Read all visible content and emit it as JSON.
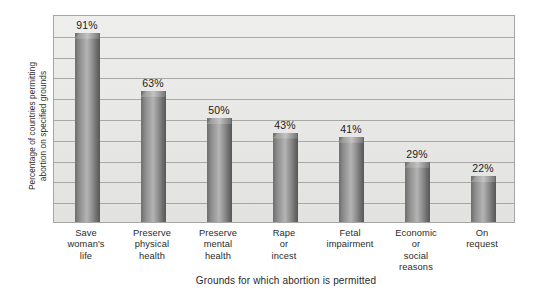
{
  "chart_data": {
    "type": "bar",
    "title": "",
    "xlabel": "Grounds for which abortion is permitted",
    "ylabel": "Percentage of countries permitting abortion on specified grounds",
    "ylabel_line1": "Percentage of countries permitting",
    "ylabel_line2": "abortion on specified grounds",
    "categories": [
      "Save woman's life",
      "Preserve physical health",
      "Preserve mental health",
      "Rape or incest",
      "Fetal impairment",
      "Economic or social reasons",
      "On request"
    ],
    "category_lines": [
      [
        "Save",
        "woman's",
        "life"
      ],
      [
        "Preserve",
        "physical",
        "health"
      ],
      [
        "Preserve",
        "mental",
        "health"
      ],
      [
        "Rape",
        "or",
        "incest"
      ],
      [
        "Fetal",
        "impairment"
      ],
      [
        "Economic",
        "or",
        "social",
        "reasons"
      ],
      [
        "On",
        "request"
      ]
    ],
    "values": [
      91,
      63,
      50,
      43,
      41,
      29,
      22
    ],
    "data_labels": [
      "91%",
      "63%",
      "50%",
      "43%",
      "41%",
      "29%",
      "22%"
    ],
    "ylim": [
      0,
      100
    ],
    "grid": true,
    "gridline_count": 10,
    "gridline_step": 10,
    "legend": "none",
    "colors": {
      "bar_dark": "#636363",
      "bar_light": "#b4b4b4",
      "plot_background": "#e9e9e7",
      "gridline": "#9d9d9b",
      "plot_border": "#a6a6a4",
      "page_background": "#ffffff",
      "text": "#1c1c1c"
    }
  }
}
